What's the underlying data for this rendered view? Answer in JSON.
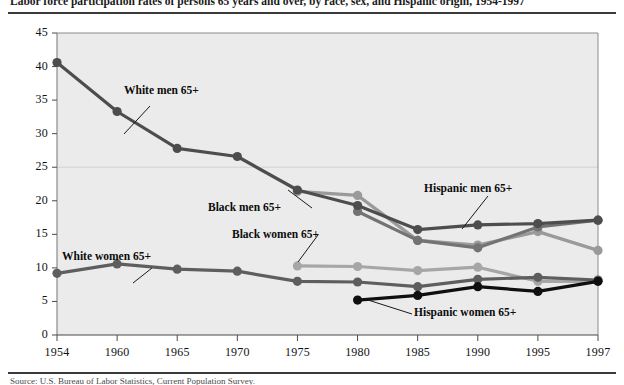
{
  "figure": {
    "title": "Labor force participation rates of persons 65 years and over, by race, sex, and Hispanic origin, 1954-1997",
    "source": "Source: U.S. Bureau of Labor Statistics, Current Population Survey."
  },
  "axes": {
    "y_ticks": [
      "0",
      "5",
      "10",
      "15",
      "20",
      "25",
      "30",
      "35",
      "40",
      "45"
    ],
    "x_ticks": [
      "1954",
      "1960",
      "1965",
      "1970",
      "1975",
      "1980",
      "1985",
      "1990",
      "1995",
      "1997"
    ]
  },
  "annotations": [
    {
      "name": "white-men",
      "text": "White men 65+"
    },
    {
      "name": "white-women",
      "text": "White women 65+"
    },
    {
      "name": "black-men",
      "text": "Black men 65+"
    },
    {
      "name": "black-women",
      "text": "Black women 65+"
    },
    {
      "name": "hispanic-men",
      "text": "Hispanic men 65+"
    },
    {
      "name": "hispanic-women",
      "text": "Hispanic women 65+"
    }
  ],
  "chart_data": {
    "type": "line",
    "title": "Labor force participation rates of persons 65 years and over, by race, sex, and Hispanic origin, 1954-1997",
    "xlabel": "",
    "ylabel": "",
    "x": [
      1954,
      1960,
      1965,
      1970,
      1975,
      1980,
      1985,
      1990,
      1995,
      1997
    ],
    "xlim": [
      1954,
      1997
    ],
    "ylim": [
      0,
      45
    ],
    "ytick_step": 5,
    "grid": true,
    "legend": "inline-annotations",
    "series": [
      {
        "name": "White men 65+",
        "color": "#4d4d4d",
        "x": [
          1954,
          1960,
          1965,
          1970,
          1975,
          1980,
          1985,
          1990,
          1995,
          1997
        ],
        "values": [
          40.6,
          33.3,
          27.8,
          26.6,
          21.6,
          19.3,
          15.7,
          16.4,
          16.6,
          17.1
        ]
      },
      {
        "name": "White women 65+",
        "color": "#5e5e5e",
        "x": [
          1954,
          1960,
          1965,
          1970,
          1975,
          1980,
          1985,
          1990,
          1995,
          1997
        ],
        "values": [
          9.2,
          10.6,
          9.8,
          9.5,
          8.0,
          7.9,
          7.2,
          8.3,
          8.6,
          8.2
        ]
      },
      {
        "name": "Black men 65+",
        "color": "#9a9a9a",
        "x": [
          1975,
          1980,
          1985,
          1990,
          1995,
          1997
        ],
        "values": [
          21.4,
          20.8,
          14.1,
          13.4,
          15.4,
          12.6
        ]
      },
      {
        "name": "Black women 65+",
        "color": "#a6a6a6",
        "x": [
          1975,
          1980,
          1985,
          1990,
          1995,
          1997
        ],
        "values": [
          10.3,
          10.2,
          9.6,
          10.1,
          8.0,
          8.0
        ]
      },
      {
        "name": "Hispanic men 65+",
        "color": "#737373",
        "x": [
          1980,
          1985,
          1990,
          1995,
          1997
        ],
        "values": [
          18.4,
          14.1,
          13.0,
          16.1,
          17.1
        ]
      },
      {
        "name": "Hispanic women 65+",
        "color": "#0f0f0f",
        "x": [
          1980,
          1985,
          1990,
          1995,
          1997
        ],
        "values": [
          5.2,
          5.9,
          7.2,
          6.5,
          8.0
        ]
      }
    ]
  }
}
